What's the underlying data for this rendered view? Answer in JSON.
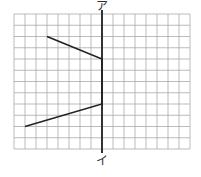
{
  "diagram": {
    "grid": {
      "cols": 16,
      "rows": 12,
      "left": 14,
      "top": 14,
      "cell_w": 11,
      "cell_h": 11.25,
      "color": "#aaaaaa"
    },
    "axis": {
      "col": 8,
      "color": "#333333",
      "top_label": "ア",
      "bottom_label": "イ"
    },
    "shape": {
      "vertices": [
        [
          3,
          2
        ],
        [
          8,
          4
        ],
        [
          8,
          8
        ],
        [
          1,
          10
        ]
      ],
      "color": "#222222"
    }
  }
}
